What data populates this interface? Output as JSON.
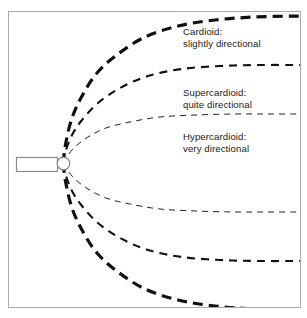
{
  "figure": {
    "background_color": "#ffffff",
    "frame_color": "#aaaaaa"
  },
  "microphone": {
    "body_name": "microphone body",
    "capsule_name": "microphone capsule",
    "outline_color": "#888888"
  },
  "labels": {
    "cardioid": {
      "line1": "Cardioid:",
      "line2": "slightly directional"
    },
    "supercardioid": {
      "line1": "Supercardioid:",
      "line2": "quite directional"
    },
    "hypercardioid": {
      "line1": "Hypercardioid:",
      "line2": "very directional"
    }
  },
  "chart_data": {
    "type": "line",
    "xlabel": "",
    "ylabel": "",
    "grid": false,
    "legend_position": "inline-annotations",
    "origin": {
      "x": 63,
      "y": 163
    },
    "series": [
      {
        "name": "Cardioid: slightly directional",
        "description": "widest pattern, largest pickup lobe",
        "color": "#111111",
        "line_width": 3.2,
        "dash": "10 6",
        "upper_points": [
          [
            63,
            163
          ],
          [
            66,
            142
          ],
          [
            72,
            118
          ],
          [
            82,
            96
          ],
          [
            97,
            73
          ],
          [
            118,
            54
          ],
          [
            145,
            37
          ],
          [
            178,
            26
          ],
          [
            215,
            20
          ],
          [
            255,
            17
          ],
          [
            300,
            16
          ]
        ],
        "lower_points": [
          [
            63,
            163
          ],
          [
            66,
            184
          ],
          [
            72,
            208
          ],
          [
            82,
            230
          ],
          [
            97,
            253
          ],
          [
            118,
            272
          ],
          [
            145,
            289
          ],
          [
            178,
            300
          ],
          [
            215,
            306
          ],
          [
            255,
            309
          ],
          [
            300,
            310
          ]
        ]
      },
      {
        "name": "Supercardioid: quite directional",
        "description": "narrower pattern, medium pickup lobe",
        "color": "#111111",
        "line_width": 2.1,
        "dash": "8 6",
        "upper_points": [
          [
            63,
            163
          ],
          [
            66,
            150
          ],
          [
            72,
            135
          ],
          [
            82,
            120
          ],
          [
            98,
            103
          ],
          [
            120,
            88
          ],
          [
            148,
            76
          ],
          [
            182,
            69
          ],
          [
            220,
            66
          ],
          [
            258,
            65
          ],
          [
            300,
            65
          ]
        ],
        "lower_points": [
          [
            63,
            163
          ],
          [
            66,
            176
          ],
          [
            72,
            191
          ],
          [
            82,
            206
          ],
          [
            98,
            223
          ],
          [
            120,
            238
          ],
          [
            148,
            250
          ],
          [
            182,
            257
          ],
          [
            220,
            260
          ],
          [
            258,
            261
          ],
          [
            300,
            261
          ]
        ]
      },
      {
        "name": "Hypercardioid: very directional",
        "description": "narrowest pattern, tightest pickup lobe",
        "color": "#222222",
        "line_width": 1,
        "dash": "6 5",
        "upper_points": [
          [
            63,
            163
          ],
          [
            68,
            155
          ],
          [
            76,
            146
          ],
          [
            88,
            137
          ],
          [
            106,
            128
          ],
          [
            130,
            122
          ],
          [
            160,
            117
          ],
          [
            196,
            115
          ],
          [
            234,
            114
          ],
          [
            268,
            114
          ],
          [
            300,
            114
          ]
        ],
        "lower_points": [
          [
            63,
            163
          ],
          [
            68,
            171
          ],
          [
            76,
            180
          ],
          [
            88,
            189
          ],
          [
            106,
            198
          ],
          [
            130,
            204
          ],
          [
            160,
            209
          ],
          [
            196,
            211
          ],
          [
            234,
            212
          ],
          [
            268,
            212
          ],
          [
            300,
            212
          ]
        ]
      }
    ],
    "annotations": [
      {
        "text": "Cardioid: slightly directional",
        "x": 183,
        "y": 32
      },
      {
        "text": "Supercardioid: quite directional",
        "x": 183,
        "y": 93
      },
      {
        "text": "Hypercardioid: very directional",
        "x": 183,
        "y": 137
      }
    ]
  }
}
